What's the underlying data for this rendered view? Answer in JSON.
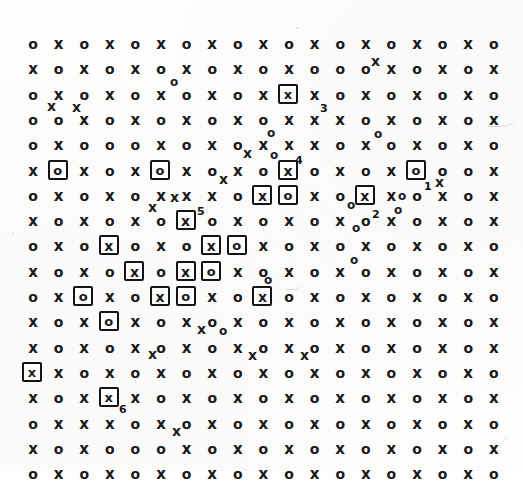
{
  "figure": {
    "kind": "scanned-grid-figure",
    "glyph_o": "o",
    "glyph_x": "x",
    "ink_color": "#19181a",
    "background_color": "#fdfdfc"
  },
  "grid": {
    "rows": 17,
    "cols": 19,
    "origin_x": 33,
    "origin_y": 44,
    "step_x": 25.6,
    "step_y": 25.3,
    "pattern": "checkerboard",
    "row_start_glyph": [
      "o",
      "x",
      "o",
      "o",
      "o",
      "x",
      "o",
      "x",
      "o",
      "x",
      "o",
      "x",
      "o",
      "x",
      "o",
      "x",
      "o"
    ],
    "cells": [
      "o x o x o x o x o x o x o x o x o x o",
      "x o x o x o x o x o x o o o x o x o x",
      "o x o x o x o x o x o x o x o x o x o",
      "o o x o x o x o x o x x x o x o x o x",
      "o x o o o x o x o x x x o x o x o x o",
      "x o x o x o x o x o x o x o x o o o x",
      "o x o x o x x x o x o x o x x o x o x",
      "x o x o x o x o x o x o x o x o x o x",
      "o x o x o x o x o x o x o x o x o x o",
      "x o x o x o x o x o x o x o x o x o x",
      "o x o x o x o x o x o x o x o x o x o",
      "x o x o x o x o x o x o x o x o x o x",
      "x o x o x o x o x o x o x o x o x o x",
      "o x o x o x o x o x o x o x o x o x o",
      "x o x o x o x o x o x o x o x o x o x",
      "o x x x o x o x o x o x o x o x o x o",
      "x o x o o o x o x o x o x o x o x o x",
      "o x o x o x o x o x o x o x o x o x o"
    ]
  },
  "boxed_sites": [
    {
      "id": "b1",
      "row": 3,
      "col": 11,
      "glyph": "x",
      "label": "3"
    },
    {
      "id": "b2",
      "row": 6,
      "col": 2,
      "glyph": "o",
      "label": ""
    },
    {
      "id": "b3",
      "row": 6,
      "col": 6,
      "glyph": "o",
      "label": ""
    },
    {
      "id": "b4",
      "row": 6,
      "col": 11,
      "glyph": "x",
      "label": "4"
    },
    {
      "id": "b5",
      "row": 6,
      "col": 16,
      "glyph": "o",
      "label": "1"
    },
    {
      "id": "b6",
      "row": 7,
      "col": 10,
      "glyph": "x",
      "label": ""
    },
    {
      "id": "b7",
      "row": 7,
      "col": 11,
      "glyph": "o",
      "label": ""
    },
    {
      "id": "b8",
      "row": 7,
      "col": 14,
      "glyph": "x",
      "label": "2"
    },
    {
      "id": "b9",
      "row": 8,
      "col": 7,
      "glyph": "x",
      "label": "5"
    },
    {
      "id": "b10",
      "row": 9,
      "col": 4,
      "glyph": "x",
      "label": ""
    },
    {
      "id": "b11",
      "row": 9,
      "col": 8,
      "glyph": "x",
      "label": ""
    },
    {
      "id": "b12",
      "row": 9,
      "col": 9,
      "glyph": "o",
      "label": ""
    },
    {
      "id": "b13",
      "row": 10,
      "col": 5,
      "glyph": "x",
      "label": ""
    },
    {
      "id": "b14",
      "row": 10,
      "col": 7,
      "glyph": "x",
      "label": ""
    },
    {
      "id": "b15",
      "row": 10,
      "col": 8,
      "glyph": "o",
      "label": ""
    },
    {
      "id": "b16",
      "row": 11,
      "col": 3,
      "glyph": "o",
      "label": ""
    },
    {
      "id": "b17",
      "row": 11,
      "col": 6,
      "glyph": "x",
      "label": ""
    },
    {
      "id": "b18",
      "row": 11,
      "col": 7,
      "glyph": "o",
      "label": ""
    },
    {
      "id": "b19",
      "row": 11,
      "col": 10,
      "glyph": "x",
      "label": ""
    },
    {
      "id": "b20",
      "row": 12,
      "col": 4,
      "glyph": "o",
      "label": ""
    },
    {
      "id": "b21",
      "row": 14,
      "col": 1,
      "glyph": "x",
      "label": ""
    },
    {
      "id": "b22",
      "row": 15,
      "col": 4,
      "glyph": "x",
      "label": "6"
    }
  ],
  "numbered_labels": [
    {
      "text": "1",
      "x": 424,
      "y": 181
    },
    {
      "text": "2",
      "x": 372,
      "y": 209
    },
    {
      "text": "3",
      "x": 320,
      "y": 103
    },
    {
      "text": "4",
      "x": 295,
      "y": 155
    },
    {
      "text": "5",
      "x": 197,
      "y": 206
    },
    {
      "text": "6",
      "x": 119,
      "y": 404
    }
  ],
  "overlay_marks": [
    {
      "glyph": "x",
      "x": 371,
      "y": 54
    },
    {
      "glyph": "o",
      "x": 170,
      "y": 76
    },
    {
      "glyph": "x",
      "x": 47,
      "y": 99
    },
    {
      "glyph": "x",
      "x": 72,
      "y": 100
    },
    {
      "glyph": "o",
      "x": 267,
      "y": 127
    },
    {
      "glyph": "o",
      "x": 374,
      "y": 128
    },
    {
      "glyph": "x",
      "x": 243,
      "y": 146
    },
    {
      "glyph": "o",
      "x": 270,
      "y": 149
    },
    {
      "glyph": "x",
      "x": 219,
      "y": 172
    },
    {
      "glyph": "x",
      "x": 435,
      "y": 175
    },
    {
      "glyph": "o",
      "x": 398,
      "y": 190
    },
    {
      "glyph": "x",
      "x": 148,
      "y": 200
    },
    {
      "glyph": "o",
      "x": 347,
      "y": 199
    },
    {
      "glyph": "x",
      "x": 170,
      "y": 190
    },
    {
      "glyph": "o",
      "x": 352,
      "y": 222
    },
    {
      "glyph": "o",
      "x": 394,
      "y": 204
    },
    {
      "glyph": "o",
      "x": 350,
      "y": 254
    },
    {
      "glyph": "o",
      "x": 264,
      "y": 274
    },
    {
      "glyph": "x",
      "x": 197,
      "y": 322
    },
    {
      "glyph": "o",
      "x": 219,
      "y": 325
    },
    {
      "glyph": "x",
      "x": 148,
      "y": 347
    },
    {
      "glyph": "x",
      "x": 248,
      "y": 348
    },
    {
      "glyph": "x",
      "x": 300,
      "y": 348
    },
    {
      "glyph": "x",
      "x": 172,
      "y": 424
    }
  ]
}
